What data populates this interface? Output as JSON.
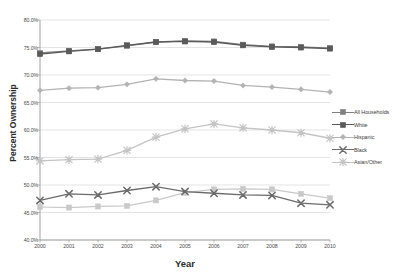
{
  "chart_data": {
    "type": "line",
    "title": "",
    "xlabel": "Year",
    "ylabel": "Percent Ownership",
    "categories": [
      "2000",
      "2001",
      "2002",
      "2003",
      "2004",
      "2005",
      "2006",
      "2007",
      "2008",
      "2009",
      "2010"
    ],
    "x": [
      2000,
      2001,
      2002,
      2003,
      2004,
      2005,
      2006,
      2007,
      2008,
      2009,
      2010
    ],
    "ylim": [
      40.0,
      80.0
    ],
    "ytick_labels": [
      "40.0%",
      "45.0%",
      "50.0%",
      "55.0%",
      "60.0%",
      "65.0%",
      "70.0%",
      "75.0%",
      "80.0%"
    ],
    "ytick_values": [
      40.0,
      45.0,
      50.0,
      55.0,
      60.0,
      65.0,
      70.0,
      75.0,
      80.0
    ],
    "grid": true,
    "legend_position": "right",
    "series": [
      {
        "name": "All Households",
        "color": "#808080",
        "marker": "square",
        "values": [
          74.0,
          74.4,
          74.7,
          75.3,
          76.0,
          76.2,
          76.1,
          75.5,
          75.2,
          75.1,
          74.9
        ]
      },
      {
        "name": "White",
        "color": "#5a5a5a",
        "marker": "square",
        "values": [
          73.8,
          74.3,
          74.7,
          75.4,
          76.0,
          76.1,
          76.0,
          75.4,
          75.1,
          75.0,
          74.8
        ]
      },
      {
        "name": "Hispanic",
        "color": "#b3b3b3",
        "marker": "diamond",
        "values": [
          67.2,
          67.6,
          67.7,
          68.3,
          69.3,
          69.0,
          68.9,
          68.1,
          67.8,
          67.4,
          66.9
        ]
      },
      {
        "name": "Black",
        "color": "#6b6b6b",
        "marker": "x",
        "values": [
          47.2,
          48.4,
          48.2,
          49.0,
          49.7,
          48.8,
          48.5,
          48.2,
          48.1,
          46.7,
          46.4
        ]
      },
      {
        "name": "Asian/Other",
        "color": "#c4c4c4",
        "marker": "star",
        "values": [
          54.4,
          54.6,
          54.7,
          56.3,
          58.7,
          60.2,
          61.1,
          60.4,
          60.0,
          59.5,
          58.5
        ]
      }
    ],
    "lower_series_note": {
      "black_like": [
        46.0,
        45.9,
        46.1,
        46.2,
        47.2,
        48.6,
        49.2,
        49.3,
        49.2,
        48.4,
        47.6
      ]
    }
  },
  "legend": {
    "items": [
      {
        "label": "All Households"
      },
      {
        "label": "White"
      },
      {
        "label": "Hispanic"
      },
      {
        "label": "Black"
      },
      {
        "label": "Asian/Other"
      }
    ]
  },
  "icons": {
    "square": "square-marker-icon",
    "diamond": "diamond-marker-icon",
    "x": "x-marker-icon",
    "star": "star-marker-icon"
  }
}
